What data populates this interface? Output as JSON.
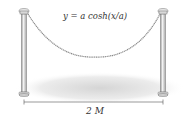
{
  "figure": {
    "equation": "y = a cosh(x/a)",
    "span_label": "2 M",
    "elements": [
      "left-post",
      "right-post",
      "hanging-chain",
      "ground-shadow",
      "span-dimension-line"
    ]
  },
  "colors": {
    "post": "#cfcfcf",
    "post_edge": "#777777",
    "chain": "#8a8a8a",
    "text": "#333333",
    "shadow": "#d9d9d9"
  }
}
